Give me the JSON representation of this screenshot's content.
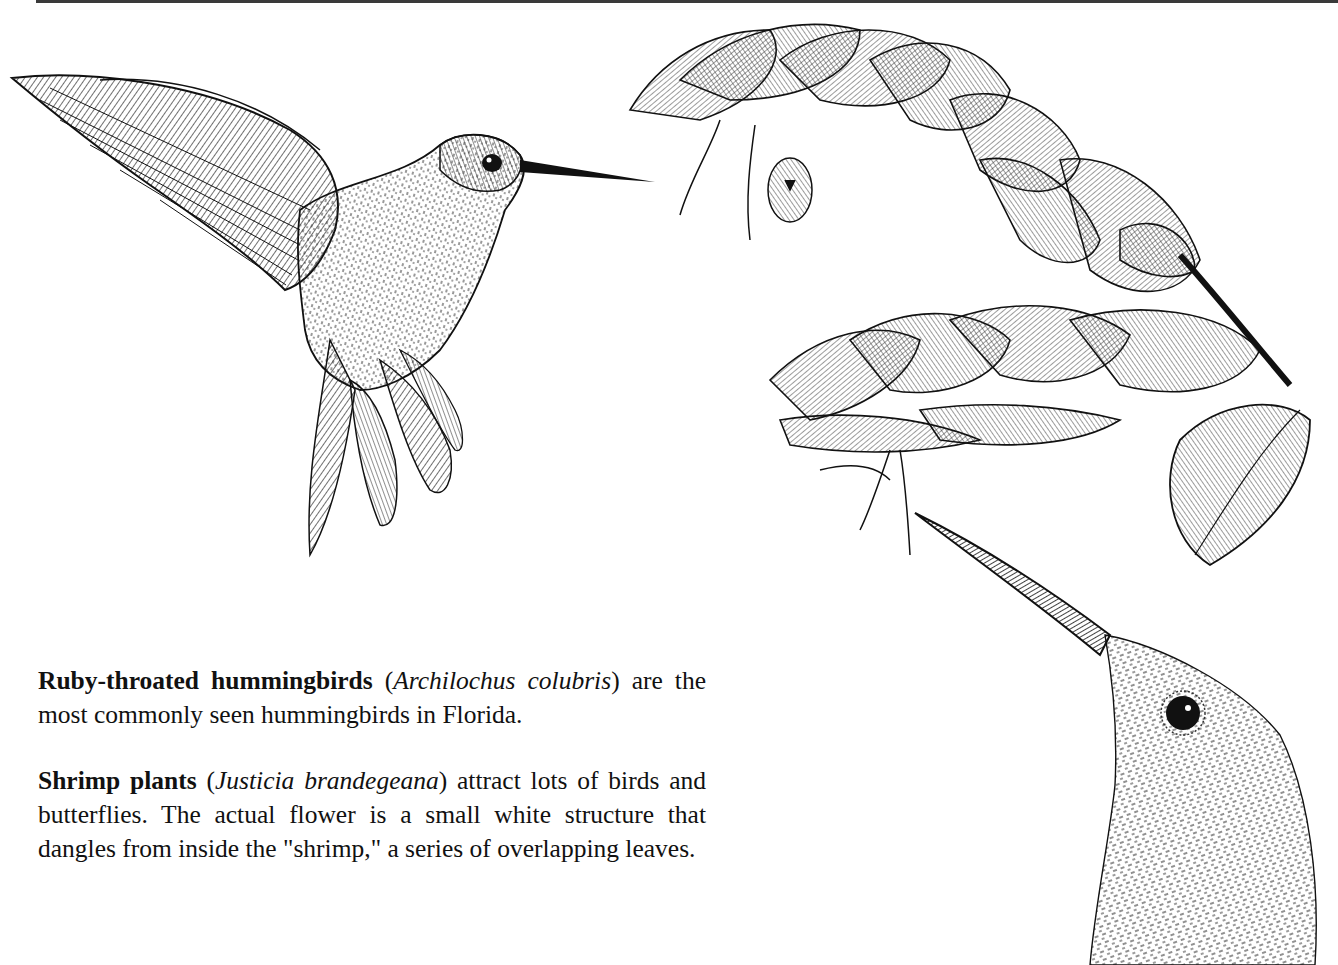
{
  "page": {
    "background": "#ffffff",
    "ink_color": "#111111"
  },
  "illustrations": [
    {
      "id": "hover-bird",
      "label": "Hovering ruby-throated hummingbird, pen-and-ink"
    },
    {
      "id": "shrimp-plant",
      "label": "Shrimp plant flower spikes with overlapping bracts"
    },
    {
      "id": "bird-head",
      "label": "Close-up of hummingbird head with long bill"
    }
  ],
  "captions": [
    {
      "bold": "Ruby-throated hummingbirds",
      "open_paren": " (",
      "italic": "Archilochus colubris",
      "rest": ") are the most commonly seen hummingbirds in Florida."
    },
    {
      "bold": "Shrimp plants",
      "open_paren": " (",
      "italic": "Justicia brandegeana",
      "rest": ") attract lots of birds and butterflies. The actual flower is a small white structure that dangles from inside the \"shrimp,\" a series of overlapping leaves."
    }
  ]
}
